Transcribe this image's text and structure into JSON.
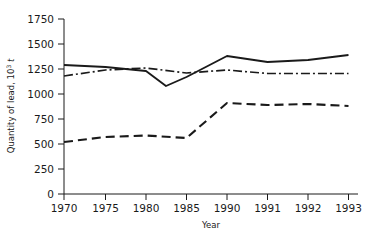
{
  "chart_data": {
    "type": "line",
    "title": "",
    "xlabel": "Year",
    "ylabel": "Quantity of lead, 10³ t",
    "ylabel_parts": {
      "main": "Quantity of lead, 10",
      "exponent": "3",
      "unit": "t"
    },
    "categories": [
      "1970",
      "1975",
      "1980",
      "1985",
      "1990",
      "1991",
      "1992",
      "1993"
    ],
    "x_positions": [
      64,
      105.5,
      146,
      186.5,
      227,
      267.5,
      308,
      348.5
    ],
    "xtick_labels": [
      "1970",
      "1975",
      "1980",
      "1985",
      "1990",
      "1991",
      "1992",
      "1993"
    ],
    "ytick_labels": [
      "0",
      "250",
      "500",
      "750",
      "1000",
      "1250",
      "1500",
      "1750"
    ],
    "ytick_values": [
      0,
      250,
      500,
      750,
      1000,
      1250,
      1500,
      1750
    ],
    "ylim": [
      0,
      1750
    ],
    "grid": false,
    "legend": "none",
    "series": [
      {
        "name": "total-consumption",
        "style": "solid",
        "dash": "none",
        "color": "#1a1a1a",
        "width": 1.9,
        "values": [
          1290,
          1270,
          1230,
          1170,
          1380,
          1320,
          1340,
          1390
        ],
        "extra_points": [
          {
            "x": 1982,
            "value": 1080
          }
        ],
        "x_plot": [
          64,
          105.5,
          146,
          166,
          186.5,
          227,
          267.5,
          308,
          348.5
        ],
        "y_plot": [
          1290,
          1270,
          1230,
          1080,
          1170,
          1380,
          1320,
          1340,
          1390
        ]
      },
      {
        "name": "secondary-production",
        "style": "dash-dot",
        "dash": "9,3,2,3",
        "color": "#1a1a1a",
        "width": 1.7,
        "values": [
          1180,
          1240,
          1260,
          1210,
          1240,
          1205,
          1205,
          1205
        ],
        "x_plot": [
          64,
          105.5,
          146,
          186.5,
          227,
          267.5,
          308,
          348.5
        ],
        "y_plot": [
          1180,
          1240,
          1260,
          1210,
          1240,
          1205,
          1205,
          1205
        ]
      },
      {
        "name": "recycled-lead",
        "style": "dashed",
        "dash": "9,5",
        "color": "#1a1a1a",
        "width": 2.1,
        "values": [
          520,
          570,
          585,
          560,
          910,
          890,
          900,
          880
        ],
        "x_plot": [
          64,
          105.5,
          146,
          186.5,
          227,
          267.5,
          308,
          348.5
        ],
        "y_plot": [
          520,
          570,
          585,
          560,
          910,
          890,
          900,
          880
        ]
      }
    ]
  },
  "axes": {
    "x_axis_name": "x-axis",
    "y_axis_name": "y-axis",
    "plot_left": 64,
    "plot_right": 358,
    "plot_top": 19,
    "plot_bottom": 194
  }
}
